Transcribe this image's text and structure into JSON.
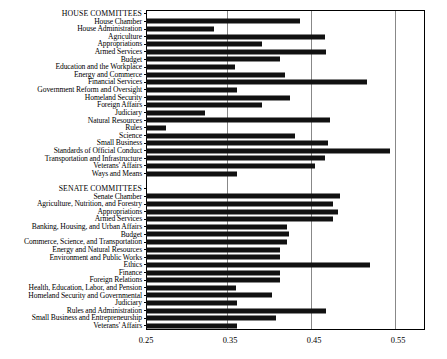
{
  "chart_data": {
    "type": "bar",
    "orientation": "horizontal",
    "title": "",
    "xlabel": "",
    "ylabel": "",
    "xlim": [
      0.25,
      0.5821
    ],
    "xticks": [
      0.25,
      0.35,
      0.45,
      0.55
    ],
    "xtick_labels": [
      "0.25",
      "0.35",
      "0.45",
      "0.55"
    ],
    "grid": "vertical",
    "legend": "none",
    "bar_color": "#111111",
    "sections": [
      {
        "heading": "HOUSE COMMITTEES",
        "categories": [
          "House Chamber",
          "House Administration",
          "Agriculture",
          "Appropriations",
          "Armed Services",
          "Budget",
          "Education and the Workplace",
          "Energy and Commerce",
          "Financial Services",
          "Government Reform and Oversight",
          "Homeland Security",
          "Foreign Affairs",
          "Judiciary",
          "Natural Resources",
          "Rules",
          "Science",
          "Small Business",
          "Standards of Official Conduct",
          "Transportation and Infrastructure",
          "Veterans' Affairs",
          "Ways and Means"
        ],
        "values": [
          0.433,
          0.331,
          0.463,
          0.388,
          0.464,
          0.41,
          0.356,
          0.415,
          0.513,
          0.358,
          0.421,
          0.388,
          0.32,
          0.469,
          0.274,
          0.427,
          0.467,
          0.54,
          0.463,
          0.451,
          0.358
        ]
      },
      {
        "heading": "SENATE COMMITTEES",
        "categories": [
          "Senate Chamber",
          "Agriculture, Nutrition, and Forestry",
          "Appropriations",
          "Armed Services",
          "Banking, Housing, and Urban Affairs",
          "Budget",
          "Commerce, Science, and Transportation",
          "Energy and Natural Resources",
          "Environment and Public Works",
          "Ethics",
          "Finance",
          "Foreign Relations",
          "Health, Education, Labor, and Pension",
          "Homeland Security and Governmental",
          "Judiciary",
          "Rules and Administration",
          "Small Business and Entrepreneurship",
          "Veterans' Affairs"
        ],
        "values": [
          0.481,
          0.473,
          0.478,
          0.472,
          0.418,
          0.42,
          0.418,
          0.41,
          0.409,
          0.517,
          0.409,
          0.409,
          0.357,
          0.4,
          0.358,
          0.464,
          0.405,
          0.358
        ]
      }
    ]
  }
}
